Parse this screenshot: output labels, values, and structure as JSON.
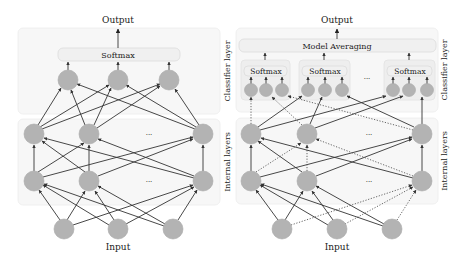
{
  "left": {
    "output_label": "Output",
    "softmax_label": "Softmax",
    "input_label": "Input",
    "classifier_layer_label": "Classifier layer",
    "internal_layers_label": "Internal layers",
    "ellipsis": "···",
    "nodes": {
      "classifier": [
        [
          68,
          80
        ],
        [
          118,
          80
        ],
        [
          169,
          80
        ]
      ],
      "internal_top": [
        [
          34,
          134
        ],
        [
          89,
          134
        ],
        [
          203,
          134
        ]
      ],
      "internal_bottom": [
        [
          34,
          181
        ],
        [
          89,
          181
        ],
        [
          203,
          181
        ]
      ],
      "input": [
        [
          64,
          229
        ],
        [
          118,
          229
        ],
        [
          173,
          229
        ]
      ]
    }
  },
  "right": {
    "output_label": "Output",
    "model_averaging_label": "Model Averaging",
    "softmax_labels": [
      "Softmax",
      "Softmax",
      "Softmax"
    ],
    "input_label": "Input",
    "classifier_layer_label": "Classifier layer",
    "internal_layers_label": "Internal layers",
    "ellipsis": "···",
    "nodes": {
      "classifier_groups": [
        [
          [
            251,
            90
          ],
          [
            266,
            90
          ],
          [
            282,
            90
          ]
        ],
        [
          [
            308,
            90
          ],
          [
            325,
            90
          ],
          [
            342,
            90
          ]
        ],
        [
          [
            393,
            90
          ],
          [
            409,
            90
          ],
          [
            427,
            90
          ]
        ]
      ],
      "internal_top": [
        [
          251,
          134
        ],
        [
          307,
          134
        ],
        [
          422,
          134
        ]
      ],
      "internal_bottom": [
        [
          251,
          181
        ],
        [
          307,
          181
        ],
        [
          422,
          181
        ]
      ],
      "input": [
        [
          282,
          229
        ],
        [
          337,
          229
        ],
        [
          392,
          229
        ]
      ]
    }
  },
  "colors": {
    "node_fill": "#b3b3b3",
    "edge": "#333333",
    "box_fill": "#f7f7f7"
  }
}
